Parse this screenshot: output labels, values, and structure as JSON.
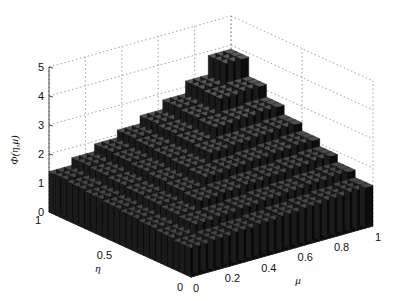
{
  "chart_data": {
    "type": "surface3d",
    "title": "",
    "xlabel": "μ",
    "ylabel": "η",
    "zlabel": "Φ(η,μ)",
    "x_ticks": [
      "0",
      "0.2",
      "0.4",
      "0.6",
      "0.8",
      "1"
    ],
    "y_ticks": [
      "0",
      "0.5",
      "1"
    ],
    "z_ticks": [
      "0",
      "1",
      "2",
      "3",
      "4",
      "5"
    ],
    "xlim": [
      0,
      1
    ],
    "ylim": [
      0,
      1
    ],
    "zlim": [
      0,
      5
    ],
    "grid": true,
    "colormap": "gray",
    "approx_values": {
      "eta_mu_corner_0_0": 1.0,
      "eta_1_mu_0": 1.2,
      "eta_0_mu_1": 1.0,
      "eta_1_mu_1": 5.0,
      "eta_0_5_mu_0_5": 2.4
    }
  },
  "labels": {
    "z_label": "Φ(η,μ)",
    "eta_label": "η",
    "mu_label": "μ"
  }
}
